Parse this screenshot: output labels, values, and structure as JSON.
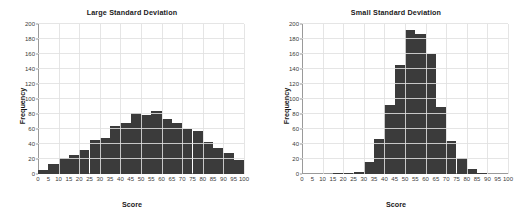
{
  "figure": {
    "background": "#ffffff",
    "bar_color": "#3b3b3b",
    "grid_color": "#e1e1e1",
    "axis_color": "#9a9a9a"
  },
  "chart_data": [
    {
      "type": "bar",
      "title": "Large Standard Deviation",
      "xlabel": "Score",
      "ylabel": "Frequency",
      "xlim": [
        0,
        100
      ],
      "ylim": [
        0,
        200
      ],
      "ytick_labels": [
        "0",
        "20",
        "40",
        "60",
        "80",
        "100",
        "120",
        "140",
        "160",
        "180",
        "200"
      ],
      "ytick_values": [
        0,
        20,
        40,
        60,
        80,
        100,
        120,
        140,
        160,
        180,
        200
      ],
      "xtick_labels": [
        "0",
        "5",
        "10",
        "15",
        "20",
        "25",
        "30",
        "35",
        "40",
        "45",
        "50",
        "55",
        "60",
        "65",
        "70",
        "75",
        "80",
        "85",
        "90",
        "95",
        "100"
      ],
      "xtick_values": [
        0,
        5,
        10,
        15,
        20,
        25,
        30,
        35,
        40,
        45,
        50,
        55,
        60,
        65,
        70,
        75,
        80,
        85,
        90,
        95,
        100
      ],
      "grid": true,
      "bin_width": 5,
      "categories": [
        0,
        5,
        10,
        15,
        20,
        25,
        30,
        35,
        40,
        45,
        50,
        55,
        60,
        65,
        70,
        75,
        80,
        85,
        90,
        95
      ],
      "values": [
        6,
        14,
        22,
        26,
        32,
        45,
        48,
        64,
        68,
        81,
        79,
        84,
        73,
        68,
        60,
        57,
        43,
        35,
        28,
        19,
        15
      ]
    },
    {
      "type": "bar",
      "title": "Small Standard Deviation",
      "xlabel": "Score",
      "ylabel": "Frequency",
      "xlim": [
        0,
        100
      ],
      "ylim": [
        0,
        200
      ],
      "ytick_labels": [
        "0",
        "20",
        "40",
        "60",
        "80",
        "100",
        "120",
        "140",
        "160",
        "180",
        "200"
      ],
      "ytick_values": [
        0,
        20,
        40,
        60,
        80,
        100,
        120,
        140,
        160,
        180,
        200
      ],
      "xtick_labels": [
        "0",
        "5",
        "10",
        "15",
        "20",
        "25",
        "30",
        "35",
        "40",
        "45",
        "50",
        "55",
        "60",
        "65",
        "70",
        "75",
        "80",
        "85",
        "90",
        "95",
        "100"
      ],
      "xtick_values": [
        0,
        5,
        10,
        15,
        20,
        25,
        30,
        35,
        40,
        45,
        50,
        55,
        60,
        65,
        70,
        75,
        80,
        85,
        90,
        95,
        100
      ],
      "grid": true,
      "bin_width": 5,
      "categories": [
        0,
        5,
        10,
        15,
        20,
        25,
        30,
        35,
        40,
        45,
        50,
        55,
        60,
        65,
        70,
        75,
        80,
        85,
        90,
        95
      ],
      "values": [
        0,
        0,
        0,
        1,
        1,
        3,
        16,
        47,
        92,
        146,
        192,
        187,
        160,
        90,
        44,
        21,
        7,
        2,
        0,
        0,
        0
      ]
    }
  ]
}
